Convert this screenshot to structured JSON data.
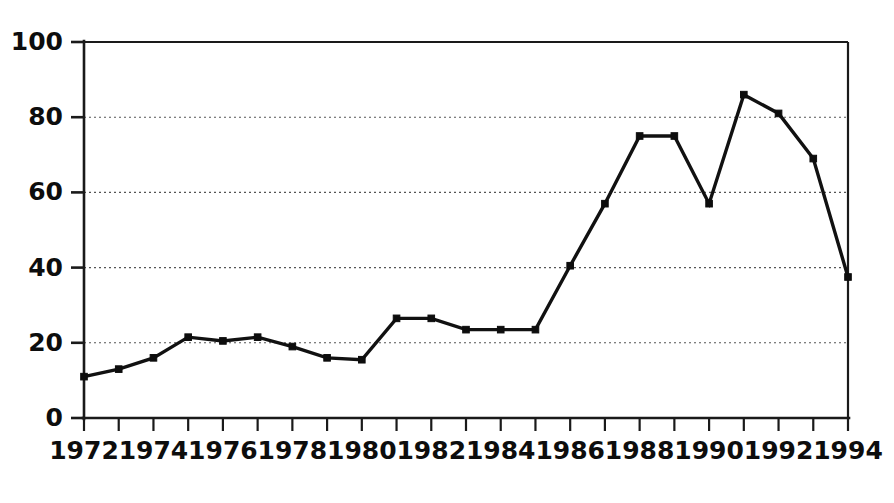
{
  "chart_data": {
    "type": "line",
    "title": "",
    "subtitle": "",
    "xlabel": "",
    "ylabel": "",
    "xlim": [
      1972,
      1994
    ],
    "ylim": [
      0,
      100
    ],
    "grid": true,
    "grid_axis": "y",
    "legend": false,
    "legend_position": "none",
    "marker": "square",
    "line_color": "#111111",
    "marker_color": "#0d0d0d",
    "grid_color": "#555555",
    "axis_color": "#1a1a1a",
    "background_color": "#ffffff",
    "x": [
      1972,
      1973,
      1974,
      1975,
      1976,
      1977,
      1978,
      1979,
      1980,
      1981,
      1982,
      1983,
      1984,
      1985,
      1986,
      1987,
      1988,
      1989,
      1990,
      1991,
      1992,
      1993,
      1994
    ],
    "values": [
      11,
      13,
      16,
      21.5,
      20.5,
      21.5,
      19,
      16,
      15.5,
      26.5,
      26.5,
      23.5,
      23.5,
      23.5,
      40.5,
      57,
      75,
      75,
      57,
      86,
      81,
      69,
      37.5
    ],
    "series": [
      {
        "name": "",
        "values": [
          11,
          13,
          16,
          21.5,
          20.5,
          21.5,
          19,
          16,
          15.5,
          26.5,
          26.5,
          23.5,
          23.5,
          23.5,
          40.5,
          57,
          75,
          75,
          57,
          86,
          81,
          69,
          37.5
        ]
      }
    ],
    "y_ticks": [
      0,
      20,
      40,
      60,
      80,
      100
    ],
    "y_tick_labels": [
      "0",
      "20",
      "40",
      "60",
      "80",
      "100"
    ],
    "x_ticks": [
      1972,
      1973,
      1974,
      1975,
      1976,
      1977,
      1978,
      1979,
      1980,
      1981,
      1982,
      1983,
      1984,
      1985,
      1986,
      1987,
      1988,
      1989,
      1990,
      1991,
      1992,
      1993,
      1994
    ],
    "x_tick_labels_shown": [
      "1972",
      "1974",
      "1976",
      "1978",
      "1980",
      "1982",
      "1984",
      "1986",
      "1988",
      "1990",
      "1992",
      "1994"
    ],
    "x_tick_label_step": 2,
    "annotations": []
  },
  "layout": {
    "plot_left": 84,
    "plot_right": 848,
    "plot_top": 42,
    "plot_bottom": 418,
    "canvas_width": 894,
    "canvas_height": 503
  }
}
